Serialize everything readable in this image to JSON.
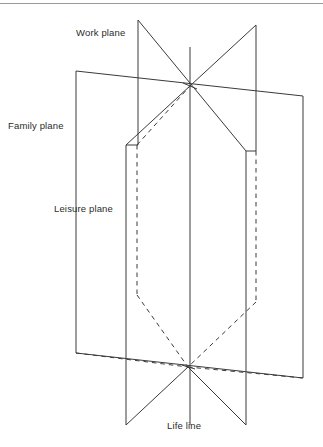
{
  "figure": {
    "stroke_color": "#3a3a3a",
    "text_color": "#2b2b2b",
    "background_color": "#ffffff",
    "labels": {
      "work_plane": "Work plane",
      "family_plane": "Family plane",
      "leisure_plane": "Leisure plane",
      "life_line": "Life line"
    },
    "elements": {
      "top_rule": "top-horizontal-rule",
      "life_line_axis": "vertical-life-line",
      "upper_node": "upper-intersection-node",
      "lower_node": "lower-intersection-node",
      "outer_plane": "family-plane-outer-quadrilateral",
      "inner_plane_solid": "leisure-plane-solid-outline",
      "inner_plane_dashed": "work-plane-hidden-dashed-outline",
      "upper_diagonals": "work-plane-upper-diagonals",
      "lower_diagonals": "life-line-lower-diagonals"
    }
  }
}
